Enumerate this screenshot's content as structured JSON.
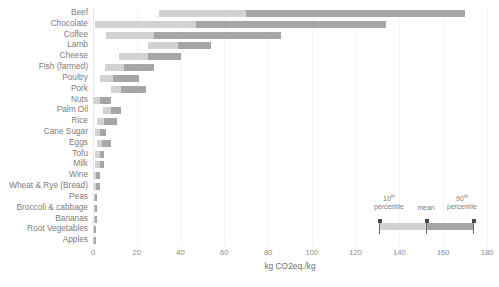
{
  "chart_data": {
    "type": "bar",
    "title": "",
    "xlabel": "kg CO2eq./kg",
    "ylabel": "",
    "xlim": [
      0,
      180
    ],
    "xticks": [
      0,
      20,
      40,
      60,
      80,
      100,
      120,
      140,
      160,
      180
    ],
    "grid": true,
    "orientation": "horizontal",
    "legend_position": "inside-bottom-right",
    "legend": {
      "p10_label_line1": "10",
      "p10_label_sup": "th",
      "p10_label_line2": "percentile",
      "mean_label": "mean",
      "p90_label_line1": "90",
      "p90_label_sup": "th",
      "p90_label_line2": "percentile"
    },
    "colors": {
      "low_segment": "#d2d2d2",
      "high_segment": "#a6a6a6",
      "text": "#7d7d7d",
      "gridline": "#f4f4f4"
    },
    "series": [
      {
        "name": "10th percentile to mean",
        "color": "#d2d2d2"
      },
      {
        "name": "mean to 90th percentile",
        "color": "#a6a6a6"
      }
    ],
    "categories": [
      "Beef",
      "Chocolate",
      "Coffee",
      "Lamb",
      "Cheese",
      "Fish (farmed)",
      "Poultry",
      "Pork",
      "Nuts",
      "Palm Oil",
      "Rice",
      "Cane Sugar",
      "Eggs",
      "Tofu",
      "Milk",
      "Wine",
      "Wheat & Rye (Bread)",
      "Peas",
      "Broccoli & cabbage",
      "Bananas",
      "Root Vegetables",
      "Apples"
    ],
    "points": [
      {
        "category": "Beef",
        "p10": 30,
        "mean": 70,
        "p90": 170
      },
      {
        "category": "Chocolate",
        "p10": 1,
        "mean": 47,
        "p90": 134
      },
      {
        "category": "Coffee",
        "p10": 6,
        "mean": 28,
        "p90": 86
      },
      {
        "category": "Lamb",
        "p10": 25,
        "mean": 39,
        "p90": 54
      },
      {
        "category": "Cheese",
        "p10": 12,
        "mean": 25,
        "p90": 40
      },
      {
        "category": "Fish (farmed)",
        "p10": 5.5,
        "mean": 14,
        "p90": 28
      },
      {
        "category": "Poultry",
        "p10": 3,
        "mean": 9,
        "p90": 21
      },
      {
        "category": "Pork",
        "p10": 8,
        "mean": 13,
        "p90": 24
      },
      {
        "category": "Nuts",
        "p10": 0,
        "mean": 3,
        "p90": 8
      },
      {
        "category": "Palm Oil",
        "p10": 4.5,
        "mean": 8,
        "p90": 13
      },
      {
        "category": "Rice",
        "p10": 2,
        "mean": 5,
        "p90": 11
      },
      {
        "category": "Cane Sugar",
        "p10": 1,
        "mean": 3,
        "p90": 6
      },
      {
        "category": "Eggs",
        "p10": 2,
        "mean": 4,
        "p90": 8
      },
      {
        "category": "Tofu",
        "p10": 1,
        "mean": 3,
        "p90": 5
      },
      {
        "category": "Milk",
        "p10": 1,
        "mean": 3,
        "p90": 5
      },
      {
        "category": "Wine",
        "p10": 0.5,
        "mean": 1.5,
        "p90": 3
      },
      {
        "category": "Wheat & Rye (Bread)",
        "p10": 0.5,
        "mean": 1.5,
        "p90": 3
      },
      {
        "category": "Peas",
        "p10": 0.3,
        "mean": 1,
        "p90": 2
      },
      {
        "category": "Broccoli & cabbage",
        "p10": 0.3,
        "mean": 1,
        "p90": 2
      },
      {
        "category": "Bananas",
        "p10": 0.3,
        "mean": 0.9,
        "p90": 1.8
      },
      {
        "category": "Root Vegetables",
        "p10": 0.2,
        "mean": 0.6,
        "p90": 1.2
      },
      {
        "category": "Apples",
        "p10": 0.2,
        "mean": 0.5,
        "p90": 1
      }
    ]
  }
}
